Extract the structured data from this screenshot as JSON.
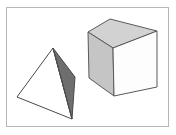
{
  "figure": {
    "background_color": "#ffffff",
    "frame": {
      "name": "figure-border",
      "stroke_color": "#b7b7b7",
      "stroke_width": 1,
      "x": 6,
      "y": 7,
      "width": 163,
      "height": 120
    },
    "caption": "",
    "shapes": [
      {
        "id": "tetrahedron",
        "label": "Tetrahedron",
        "outline_color": "#4a4a4a",
        "outline_width": 1,
        "vertices": {
          "apex": [
            53,
            48
          ],
          "left": [
            17,
            97
          ],
          "bottom": [
            72,
            119
          ],
          "back_right": [
            75,
            77
          ]
        },
        "faces": [
          {
            "name": "tetrahedron-front-face",
            "fill": "#ffffff",
            "points": "53,48 17,97 72,119"
          },
          {
            "name": "tetrahedron-right-face",
            "fill": "#6e6e6e",
            "points": "53,48 75,77 72,119"
          }
        ]
      },
      {
        "id": "cube",
        "label": "Cube",
        "outline_color": "#5a5a5a",
        "outline_width": 1,
        "vertices": {
          "top_back": [
            110,
            19
          ],
          "top_left": [
            88,
            32
          ],
          "top_right": [
            157,
            31
          ],
          "top_front": [
            113,
            48
          ],
          "bottom_left": [
            89,
            78
          ],
          "bottom_front": [
            114,
            96
          ],
          "bottom_right": [
            157,
            87
          ]
        },
        "faces": [
          {
            "name": "cube-top-face",
            "fill": "#d2d2d2",
            "points": "110,19 157,31 113,48 88,32"
          },
          {
            "name": "cube-left-face",
            "fill": "#c5c5c5",
            "points": "88,32 113,48 114,96 89,78"
          },
          {
            "name": "cube-right-face",
            "fill": "#fdfdfd",
            "points": "113,48 157,31 157,87 114,96"
          }
        ]
      }
    ]
  }
}
